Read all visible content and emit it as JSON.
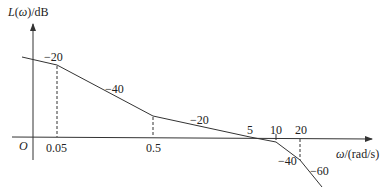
{
  "diagram": {
    "type": "bode-magnitude-asymptotic",
    "y_axis_label": "L(ω)/dB",
    "x_axis_label": "ω/(rad/s)",
    "origin_label": "O",
    "x_ticks": [
      {
        "label": "0.05",
        "x": 57
      },
      {
        "label": "0.5",
        "x": 153
      },
      {
        "label": "5",
        "x": 250
      },
      {
        "label": "10",
        "x": 276
      },
      {
        "label": "20",
        "x": 300
      }
    ],
    "segments": [
      {
        "slope_label": "−20",
        "from": "start",
        "to": "0.05"
      },
      {
        "slope_label": "−40",
        "from": "0.05",
        "to": "0.5"
      },
      {
        "slope_label": "−20",
        "from": "0.5",
        "to": "10"
      },
      {
        "slope_label": "−40",
        "from": "10",
        "to": "20"
      },
      {
        "slope_label": "−60",
        "from": "20",
        "to": "end"
      }
    ],
    "corner_frequencies": [
      "0.05",
      "0.5",
      "10",
      "20"
    ],
    "crossover_frequency": "5"
  }
}
